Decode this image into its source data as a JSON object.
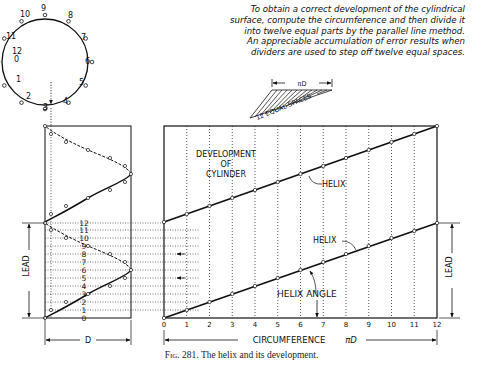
{
  "note": {
    "lines": [
      "To obtain a correct development of the cylindrical",
      "surface, compute the circumference and then divide it",
      "into twelve equal parts by the parallel line method.",
      "An appreciable accumulation of error results when",
      "dividers are used to step off twelve equal spaces."
    ]
  },
  "construction": {
    "pi_d_label": "πD",
    "equal_spaces_label": "12 EQUAL SPACES"
  },
  "circle": {
    "point_labels": [
      "12",
      "0",
      "1",
      "2",
      "3",
      "4",
      "5",
      "6",
      "7",
      "8",
      "9",
      "10",
      "11"
    ]
  },
  "cylinder_view": {
    "division_labels": [
      "0",
      "1",
      "2",
      "3",
      "4",
      "5",
      "6",
      "7",
      "8",
      "9",
      "10",
      "11",
      "12"
    ],
    "lead_label": "LEAD",
    "diameter_label": "D"
  },
  "development": {
    "title_lines": [
      "DEVELOPMENT",
      "OF",
      "CYLINDER"
    ],
    "helix_upper_label": "HELIX",
    "helix_lower_label": "HELIX",
    "helix_angle_label": "HELIX ANGLE",
    "column_labels": [
      "0",
      "1",
      "2",
      "3",
      "4",
      "5",
      "6",
      "7",
      "8",
      "9",
      "10",
      "11",
      "12"
    ],
    "circumference_label": "CIRCUMFERENCE",
    "circumference_symbol": "πD",
    "lead_label": "LEAD"
  },
  "caption": {
    "fig": "Fig. 281.",
    "text": "The helix and its development."
  }
}
